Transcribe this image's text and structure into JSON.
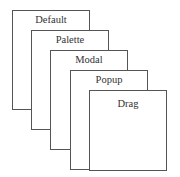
{
  "layers": [
    {
      "label": "Default"
    },
    {
      "label": "Palette"
    },
    {
      "label": "Modal"
    },
    {
      "label": "Popup"
    },
    {
      "label": "Drag"
    }
  ]
}
